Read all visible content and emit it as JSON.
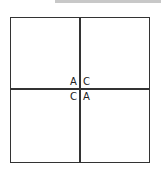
{
  "diagram": {
    "type": "quadrant-grid",
    "labels": {
      "top_left": "A",
      "top_right": "C",
      "bottom_left": "C",
      "bottom_right": "A"
    }
  }
}
